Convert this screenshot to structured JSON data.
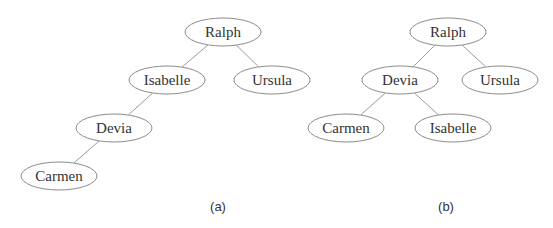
{
  "figure": {
    "trees": [
      {
        "id": "a",
        "caption": "(a)",
        "caption_pos": {
          "x": 218,
          "y": 211
        },
        "nodes": [
          {
            "id": "ralph",
            "label": "Ralph",
            "cx": 223,
            "cy": 32,
            "rx": 38,
            "ry": 14
          },
          {
            "id": "isabelle",
            "label": "Isabelle",
            "cx": 167,
            "cy": 80,
            "rx": 38,
            "ry": 14
          },
          {
            "id": "ursula",
            "label": "Ursula",
            "cx": 272,
            "cy": 80,
            "rx": 38,
            "ry": 14
          },
          {
            "id": "devia",
            "label": "Devia",
            "cx": 114,
            "cy": 128,
            "rx": 38,
            "ry": 14
          },
          {
            "id": "carmen",
            "label": "Carmen",
            "cx": 59,
            "cy": 176,
            "rx": 38,
            "ry": 14
          }
        ],
        "edges": [
          {
            "from": "ralph",
            "to": "isabelle"
          },
          {
            "from": "ralph",
            "to": "ursula"
          },
          {
            "from": "isabelle",
            "to": "devia"
          },
          {
            "from": "devia",
            "to": "carmen"
          }
        ]
      },
      {
        "id": "b",
        "caption": "(b)",
        "caption_pos": {
          "x": 446,
          "y": 211
        },
        "nodes": [
          {
            "id": "ralph",
            "label": "Ralph",
            "cx": 448,
            "cy": 32,
            "rx": 38,
            "ry": 14
          },
          {
            "id": "devia",
            "label": "Devia",
            "cx": 400,
            "cy": 80,
            "rx": 38,
            "ry": 14
          },
          {
            "id": "ursula",
            "label": "Ursula",
            "cx": 500,
            "cy": 80,
            "rx": 38,
            "ry": 14
          },
          {
            "id": "carmen",
            "label": "Carmen",
            "cx": 346,
            "cy": 128,
            "rx": 38,
            "ry": 14
          },
          {
            "id": "isabelle",
            "label": "Isabelle",
            "cx": 453,
            "cy": 128,
            "rx": 38,
            "ry": 14
          }
        ],
        "edges": [
          {
            "from": "ralph",
            "to": "devia"
          },
          {
            "from": "ralph",
            "to": "ursula"
          },
          {
            "from": "devia",
            "to": "carmen"
          },
          {
            "from": "devia",
            "to": "isabelle"
          }
        ]
      }
    ]
  }
}
